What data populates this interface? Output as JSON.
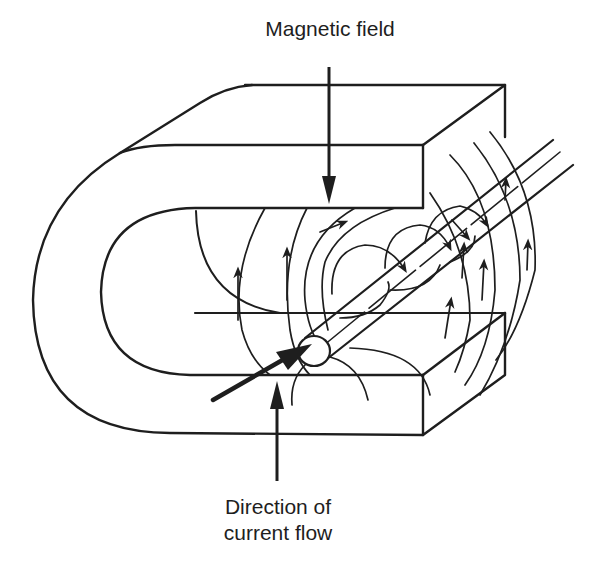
{
  "figure": {
    "labels": {
      "magnetic_field": "Magnetic field",
      "current_flow_line1": "Direction of",
      "current_flow_line2": "current flow"
    },
    "colors": {
      "ink": "#1e1e1e",
      "background": "#ffffff"
    }
  }
}
